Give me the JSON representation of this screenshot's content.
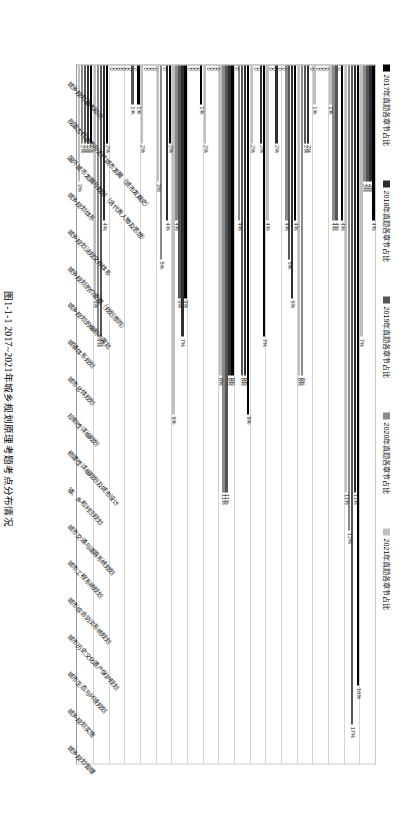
{
  "caption": "图1-1-1  2017~2021年城乡规划原理考题考点分布情况",
  "legend": {
    "items": [
      {
        "label": "2017年真题各章节占比",
        "color": "#000000"
      },
      {
        "label": "2018年真题各章节占比",
        "color": "#2e2e2e"
      },
      {
        "label": "2019年真题各章节占比",
        "color": "#555555"
      },
      {
        "label": "2020年真题各章节占比",
        "color": "#8a8a8a"
      },
      {
        "label": "2021年真题各章节占比",
        "color": "#bfbfbf"
      }
    ]
  },
  "chart_data": {
    "type": "bar",
    "orientation": "horizontal",
    "title": "图1-1-1  2017~2021年城乡规划原理考题考点分布情况",
    "xlabel": "",
    "ylabel": "",
    "xlim": [
      0,
      18
    ],
    "grid": true,
    "legend_position": "top",
    "value_unit": "%",
    "categories": [
      "城乡规划基本知识",
      "我国古代城市与近代城市发展（城市发展史）",
      "国外城市发展与规划（含代表人物及思想）",
      "城乡规划体系",
      "城乡规划法规文件体系",
      "城乡规划的价值观（规划原则）",
      "城乡规划的编制与审批",
      "城镇体系规划",
      "城市总体规划",
      "控制性详细规划",
      "修建性详细规划及城市设计",
      "镇、乡和村庄规划",
      "城市交通与道路系统规划",
      "城市工程系统规划",
      "城市综合防灾系统规划",
      "城市历史文化遗产保护规划",
      "城市生态与环境规划",
      "城乡规划实施",
      "城乡规划管理"
    ],
    "series": [
      {
        "name": "2017年真题各章节占比",
        "color": "#000000",
        "values": [
          4,
          16,
          4,
          0,
          0,
          4,
          0,
          7,
          9,
          8,
          0,
          1,
          6,
          2,
          0,
          1,
          0,
          2,
          2
        ]
      },
      {
        "name": "2018年真题各章节占比",
        "color": "#2e2e2e",
        "values": [
          3,
          11,
          0,
          0,
          2,
          6,
          2,
          2,
          8,
          8,
          0,
          0,
          7,
          4,
          0,
          0,
          0,
          4,
          2
        ]
      },
      {
        "name": "2019年真题各章节占比",
        "color": "#555555",
        "values": [
          3,
          17,
          4,
          0,
          2,
          5,
          0,
          0,
          8,
          11,
          0,
          0,
          6,
          0,
          0,
          1,
          0,
          7,
          2
        ]
      },
      {
        "name": "2020年真题各章节占比",
        "color": "#8a8a8a",
        "values": [
          3,
          12,
          4,
          0,
          8,
          4,
          0,
          0,
          4,
          11,
          0,
          0,
          4,
          5,
          0,
          0,
          0,
          7,
          2
        ]
      },
      {
        "name": "2021年真题各章节占比",
        "color": "#bfbfbf",
        "values": [
          7,
          11,
          1,
          1,
          8,
          0,
          4,
          2,
          0,
          8,
          2,
          0,
          9,
          3,
          2,
          0,
          0,
          6,
          3
        ]
      }
    ],
    "bars": [
      {
        "category": "城乡规划基本知识",
        "points": [
          {
            "series": "2017年真题各章节占比",
            "value": 4,
            "label": "4%"
          },
          {
            "series": "2018年真题各章节占比",
            "value": 3,
            "label": "3%"
          },
          {
            "series": "2019年真题各章节占比",
            "value": 3,
            "label": "3%"
          },
          {
            "series": "2020年真题各章节占比",
            "value": 3,
            "label": "3%"
          },
          {
            "series": "2021年真题各章节占比",
            "value": 7,
            "label": "7%"
          }
        ]
      },
      {
        "category": "我国古代城市与近代城市发展（城市发展史）",
        "points": [
          {
            "series": "2017年真题各章节占比",
            "value": 16,
            "label": "16%"
          },
          {
            "series": "2018年真题各章节占比",
            "value": 11,
            "label": "11%"
          },
          {
            "series": "2019年真题各章节占比",
            "value": 17,
            "label": "17%"
          },
          {
            "series": "2020年真题各章节占比",
            "value": 12,
            "label": "12%"
          },
          {
            "series": "2021年真题各章节占比",
            "value": 11,
            "label": "11%"
          }
        ]
      },
      {
        "category": "国外城市发展与规划（含代表人物及思想）",
        "points": [
          {
            "series": "2017年真题各章节占比",
            "value": 4,
            "label": "4%"
          },
          {
            "series": "2018年真题各章节占比",
            "value": 0,
            "label": "0"
          },
          {
            "series": "2019年真题各章节占比",
            "value": 4,
            "label": "4%"
          },
          {
            "series": "2020年真题各章节占比",
            "value": 4,
            "label": "4%"
          },
          {
            "series": "2021年真题各章节占比",
            "value": 1,
            "label": "1%"
          }
        ]
      },
      {
        "category": "城乡规划体系",
        "points": [
          {
            "series": "2017年真题各章节占比",
            "value": 0,
            "label": "0"
          },
          {
            "series": "2018年真题各章节占比",
            "value": 0,
            "label": "0"
          },
          {
            "series": "2019年真题各章节占比",
            "value": 0,
            "label": "0"
          },
          {
            "series": "2020年真题各章节占比",
            "value": 0,
            "label": "0"
          },
          {
            "series": "2021年真题各章节占比",
            "value": 1,
            "label": "1%"
          }
        ]
      },
      {
        "category": "城乡规划法规文件体系",
        "points": [
          {
            "series": "2017年真题各章节占比",
            "value": 0,
            "label": "0"
          },
          {
            "series": "2018年真题各章节占比",
            "value": 2,
            "label": "2%"
          },
          {
            "series": "2019年真题各章节占比",
            "value": 2,
            "label": "2%"
          },
          {
            "series": "2020年真题各章节占比",
            "value": 8,
            "label": "8%"
          },
          {
            "series": "2021年真题各章节占比",
            "value": 8,
            "label": "8%"
          }
        ]
      },
      {
        "category": "城乡规划的价值观（规划原则）",
        "points": [
          {
            "series": "2017年真题各章节占比",
            "value": 4,
            "label": "4%"
          },
          {
            "series": "2018年真题各章节占比",
            "value": 6,
            "label": "6%"
          },
          {
            "series": "2019年真题各章节占比",
            "value": 5,
            "label": "5%"
          },
          {
            "series": "2020年真题各章节占比",
            "value": 4,
            "label": "4%"
          },
          {
            "series": "2021年真题各章节占比",
            "value": 0,
            "label": "0"
          }
        ]
      },
      {
        "category": "城乡规划的编制与审批",
        "points": [
          {
            "series": "2017年真题各章节占比",
            "value": 0,
            "label": "0"
          },
          {
            "series": "2018年真题各章节占比",
            "value": 2,
            "label": "2%"
          },
          {
            "series": "2019年真题各章节占比",
            "value": 0,
            "label": "0"
          },
          {
            "series": "2020年真题各章节占比",
            "value": 0,
            "label": "0"
          },
          {
            "series": "2021年真题各章节占比",
            "value": 4,
            "label": "4%"
          }
        ]
      },
      {
        "category": "城镇体系规划",
        "points": [
          {
            "series": "2017年真题各章节占比",
            "value": 7,
            "label": "7%"
          },
          {
            "series": "2018年真题各章节占比",
            "value": 2,
            "label": "2%"
          },
          {
            "series": "2019年真题各章节占比",
            "value": 0,
            "label": "0"
          },
          {
            "series": "2020年真题各章节占比",
            "value": 0,
            "label": "0"
          },
          {
            "series": "2021年真题各章节占比",
            "value": 2,
            "label": "2%"
          }
        ]
      },
      {
        "category": "城市总体规划",
        "points": [
          {
            "series": "2017年真题各章节占比",
            "value": 9,
            "label": "9%"
          },
          {
            "series": "2018年真题各章节占比",
            "value": 8,
            "label": "8%"
          },
          {
            "series": "2019年真题各章节占比",
            "value": 8,
            "label": "8%"
          },
          {
            "series": "2020年真题各章节占比",
            "value": 4,
            "label": "4%"
          },
          {
            "series": "2021年真题各章节占比",
            "value": 0,
            "label": "0"
          }
        ]
      },
      {
        "category": "控制性详细规划",
        "points": [
          {
            "series": "2017年真题各章节占比",
            "value": 8,
            "label": "8%"
          },
          {
            "series": "2018年真题各章节占比",
            "value": 8,
            "label": "8%"
          },
          {
            "series": "2019年真题各章节占比",
            "value": 11,
            "label": "11%"
          },
          {
            "series": "2020年真题各章节占比",
            "value": 11,
            "label": "11%"
          },
          {
            "series": "2021年真题各章节占比",
            "value": 8,
            "label": "8%"
          }
        ]
      },
      {
        "category": "修建性详细规划及城市设计",
        "points": [
          {
            "series": "2017年真题各章节占比",
            "value": 0,
            "label": "0"
          },
          {
            "series": "2018年真题各章节占比",
            "value": 0,
            "label": "0"
          },
          {
            "series": "2019年真题各章节占比",
            "value": 0,
            "label": "0"
          },
          {
            "series": "2020年真题各章节占比",
            "value": 0,
            "label": "0"
          },
          {
            "series": "2021年真题各章节占比",
            "value": 2,
            "label": "2%"
          }
        ]
      },
      {
        "category": "镇、乡和村庄规划",
        "points": [
          {
            "series": "2017年真题各章节占比",
            "value": 1,
            "label": "1%"
          },
          {
            "series": "2018年真题各章节占比",
            "value": 0,
            "label": "0"
          },
          {
            "series": "2019年真题各章节占比",
            "value": 0,
            "label": "0"
          },
          {
            "series": "2020年真题各章节占比",
            "value": 0,
            "label": "0"
          },
          {
            "series": "2021年真题各章节占比",
            "value": 0,
            "label": "0"
          }
        ]
      },
      {
        "category": "城市交通与道路系统规划",
        "points": [
          {
            "series": "2017年真题各章节占比",
            "value": 6,
            "label": "6%"
          },
          {
            "series": "2018年真题各章节占比",
            "value": 7,
            "label": "7%"
          },
          {
            "series": "2019年真题各章节占比",
            "value": 6,
            "label": "6%"
          },
          {
            "series": "2020年真题各章节占比",
            "value": 4,
            "label": "4%"
          },
          {
            "series": "2021年真题各章节占比",
            "value": 9,
            "label": "9%"
          }
        ]
      },
      {
        "category": "城市工程系统规划",
        "points": [
          {
            "series": "2017年真题各章节占比",
            "value": 2,
            "label": "2%"
          },
          {
            "series": "2018年真题各章节占比",
            "value": 4,
            "label": "4%"
          },
          {
            "series": "2019年真题各章节占比",
            "value": 0,
            "label": "0"
          },
          {
            "series": "2020年真题各章节占比",
            "value": 5,
            "label": "5%"
          },
          {
            "series": "2021年真题各章节占比",
            "value": 3,
            "label": "3%"
          }
        ]
      },
      {
        "category": "城市综合防灾系统规划",
        "points": [
          {
            "series": "2017年真题各章节占比",
            "value": 0,
            "label": "0"
          },
          {
            "series": "2018年真题各章节占比",
            "value": 0,
            "label": "0"
          },
          {
            "series": "2019年真题各章节占比",
            "value": 0,
            "label": "0"
          },
          {
            "series": "2020年真题各章节占比",
            "value": 0,
            "label": "0"
          },
          {
            "series": "2021年真题各章节占比",
            "value": 2,
            "label": "2%"
          }
        ]
      },
      {
        "category": "城市历史文化遗产保护规划",
        "points": [
          {
            "series": "2017年真题各章节占比",
            "value": 1,
            "label": "1%"
          },
          {
            "series": "2018年真题各章节占比",
            "value": 0,
            "label": "0"
          },
          {
            "series": "2019年真题各章节占比",
            "value": 1,
            "label": "1%"
          },
          {
            "series": "2020年真题各章节占比",
            "value": 0,
            "label": "0"
          },
          {
            "series": "2021年真题各章节占比",
            "value": 0,
            "label": "0"
          }
        ]
      },
      {
        "category": "城市生态与环境规划",
        "points": [
          {
            "series": "2017年真题各章节占比",
            "value": 0,
            "label": "0"
          },
          {
            "series": "2018年真题各章节占比",
            "value": 0,
            "label": "0"
          },
          {
            "series": "2019年真题各章节占比",
            "value": 0,
            "label": "0"
          },
          {
            "series": "2020年真题各章节占比",
            "value": 0,
            "label": "0"
          },
          {
            "series": "2021年真题各章节占比",
            "value": 0,
            "label": "0"
          }
        ]
      },
      {
        "category": "城乡规划实施",
        "points": [
          {
            "series": "2017年真题各章节占比",
            "value": 2,
            "label": "2%"
          },
          {
            "series": "2018年真题各章节占比",
            "value": 4,
            "label": "4%"
          },
          {
            "series": "2019年真题各章节占比",
            "value": 7,
            "label": "7%"
          },
          {
            "series": "2020年真题各章节占比",
            "value": 7,
            "label": "7%"
          },
          {
            "series": "2021年真题各章节占比",
            "value": 6,
            "label": "6%"
          }
        ]
      },
      {
        "category": "城乡规划管理",
        "points": [
          {
            "series": "2017年真题各章节占比",
            "value": 2,
            "label": "2%"
          },
          {
            "series": "2018年真题各章节占比",
            "value": 2,
            "label": "2%"
          },
          {
            "series": "2019年真题各章节占比",
            "value": 2,
            "label": "2%"
          },
          {
            "series": "2020年真题各章节占比",
            "value": 2,
            "label": "2%"
          },
          {
            "series": "2021年真题各章节占比",
            "value": 3,
            "label": "3%"
          }
        ]
      }
    ]
  }
}
